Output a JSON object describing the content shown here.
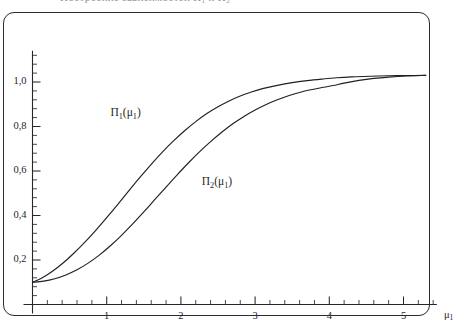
{
  "caption": {
    "text": "Построение зависимостей Π₁ и Π₂"
  },
  "chart_data": {
    "type": "line",
    "title": "",
    "subtitle": "",
    "xlabel": "μ₁",
    "ylabel": "",
    "xlim": [
      0,
      5.45
    ],
    "ylim": [
      0,
      1.14
    ],
    "grid": false,
    "legend": "inline-labels",
    "decimal_separator": ",",
    "x_ticks": [
      {
        "value": 1,
        "label": "1"
      },
      {
        "value": 2,
        "label": "2"
      },
      {
        "value": 3,
        "label": "3"
      },
      {
        "value": 4,
        "label": "4"
      },
      {
        "value": 5,
        "label": "5"
      }
    ],
    "x_minor_tick_step": 0.2,
    "y_ticks": [
      {
        "value": 0.2,
        "label": "0,2"
      },
      {
        "value": 0.4,
        "label": "0,4"
      },
      {
        "value": 0.6,
        "label": "0,6"
      },
      {
        "value": 0.8,
        "label": "0,8"
      },
      {
        "value": 1.0,
        "label": "1,0"
      }
    ],
    "y_minor_tick_step": 0.04,
    "annotations": [
      {
        "name": "pi1-label",
        "text_html": "Π<sub>1</sub>(μ<sub>1</sub>)",
        "text": "Π1(μ1)",
        "x": 1.05,
        "y": 0.855
      },
      {
        "name": "pi2-label",
        "text_html": "Π<sub>2</sub>(μ<sub>1</sub>)",
        "text": "Π2(μ1)",
        "x": 2.28,
        "y": 0.545
      }
    ],
    "series": [
      {
        "name": "Π1(μ1)",
        "color": "#1f1f25",
        "points": [
          [
            0.0,
            0.1
          ],
          [
            0.12,
            0.118
          ],
          [
            0.25,
            0.145
          ],
          [
            0.4,
            0.183
          ],
          [
            0.55,
            0.228
          ],
          [
            0.7,
            0.278
          ],
          [
            0.85,
            0.332
          ],
          [
            1.0,
            0.39
          ],
          [
            1.15,
            0.45
          ],
          [
            1.3,
            0.512
          ],
          [
            1.45,
            0.572
          ],
          [
            1.6,
            0.63
          ],
          [
            1.75,
            0.685
          ],
          [
            1.9,
            0.735
          ],
          [
            2.05,
            0.781
          ],
          [
            2.2,
            0.822
          ],
          [
            2.35,
            0.858
          ],
          [
            2.5,
            0.889
          ],
          [
            2.65,
            0.915
          ],
          [
            2.8,
            0.937
          ],
          [
            2.95,
            0.955
          ],
          [
            3.1,
            0.97
          ],
          [
            3.3,
            0.985
          ],
          [
            3.5,
            0.997
          ],
          [
            3.7,
            1.006
          ],
          [
            3.9,
            1.013
          ],
          [
            4.1,
            1.019
          ],
          [
            4.3,
            1.023
          ],
          [
            4.55,
            1.026
          ],
          [
            4.8,
            1.028
          ],
          [
            5.05,
            1.029
          ],
          [
            5.3,
            1.03
          ]
        ]
      },
      {
        "name": "Π2(μ1)",
        "color": "#1f1f25",
        "points": [
          [
            0.0,
            0.1
          ],
          [
            0.15,
            0.105
          ],
          [
            0.3,
            0.116
          ],
          [
            0.45,
            0.133
          ],
          [
            0.6,
            0.156
          ],
          [
            0.75,
            0.186
          ],
          [
            0.9,
            0.222
          ],
          [
            1.05,
            0.264
          ],
          [
            1.2,
            0.311
          ],
          [
            1.35,
            0.362
          ],
          [
            1.5,
            0.416
          ],
          [
            1.65,
            0.472
          ],
          [
            1.8,
            0.528
          ],
          [
            1.95,
            0.583
          ],
          [
            2.1,
            0.636
          ],
          [
            2.25,
            0.686
          ],
          [
            2.4,
            0.732
          ],
          [
            2.55,
            0.774
          ],
          [
            2.7,
            0.812
          ],
          [
            2.85,
            0.845
          ],
          [
            3.0,
            0.874
          ],
          [
            3.15,
            0.899
          ],
          [
            3.3,
            0.92
          ],
          [
            3.45,
            0.938
          ],
          [
            3.6,
            0.953
          ],
          [
            3.75,
            0.965
          ],
          [
            3.9,
            0.975
          ],
          [
            4.05,
            0.984
          ],
          [
            4.2,
            0.995
          ],
          [
            4.4,
            1.007
          ],
          [
            4.6,
            1.016
          ],
          [
            4.8,
            1.022
          ],
          [
            5.05,
            1.027
          ],
          [
            5.3,
            1.03
          ]
        ]
      }
    ]
  }
}
